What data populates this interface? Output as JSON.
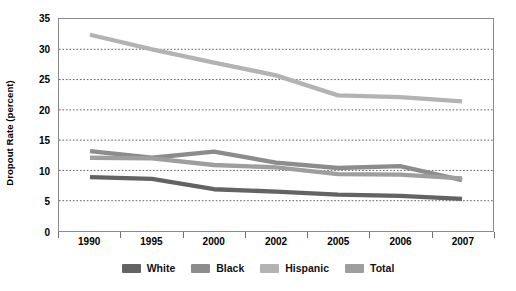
{
  "chart_data": {
    "type": "line",
    "title": "",
    "xlabel": "",
    "ylabel": "Dropout Rate (percent)",
    "categories": [
      "1990",
      "1995",
      "2000",
      "2002",
      "2005",
      "2006",
      "2007"
    ],
    "ylim": [
      0,
      35
    ],
    "ytick_values": [
      0,
      5,
      10,
      15,
      20,
      25,
      30,
      35
    ],
    "ytick_labels": [
      "0",
      "5",
      "10",
      "15",
      "20",
      "25",
      "30",
      "35"
    ],
    "grid": "horizontal-dotted",
    "legend_position": "bottom-center",
    "series": [
      {
        "name": "White",
        "color": "#636363",
        "values": [
          8.9,
          8.6,
          6.9,
          6.5,
          6.0,
          5.8,
          5.3
        ]
      },
      {
        "name": "Black",
        "color": "#8c8c8c",
        "values": [
          13.2,
          12.1,
          13.1,
          11.3,
          10.4,
          10.7,
          8.4
        ]
      },
      {
        "name": "Hispanic",
        "color": "#b3b3b3",
        "values": [
          32.4,
          30.0,
          27.8,
          25.7,
          22.4,
          22.1,
          21.4
        ]
      },
      {
        "name": "Total",
        "color": "#9e9e9e",
        "values": [
          12.1,
          12.0,
          10.9,
          10.5,
          9.4,
          9.3,
          8.7
        ]
      }
    ]
  },
  "axis": {
    "y_title": "Dropout Rate (percent)"
  },
  "legend": {
    "items": [
      {
        "label": "White",
        "color": "#636363"
      },
      {
        "label": "Black",
        "color": "#8c8c8c"
      },
      {
        "label": "Hispanic",
        "color": "#b3b3b3"
      },
      {
        "label": "Total",
        "color": "#9e9e9e"
      }
    ]
  }
}
